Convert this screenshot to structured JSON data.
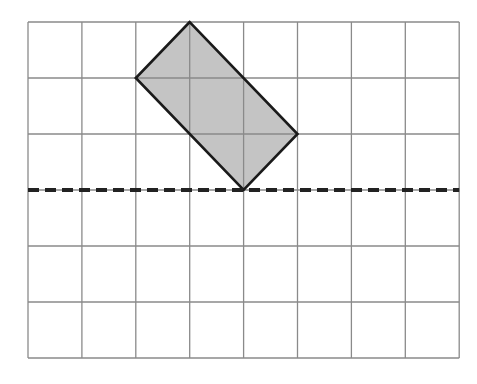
{
  "diagram": {
    "type": "grid-reflection",
    "grid": {
      "columns": 8,
      "rows": 6,
      "origin_px": [
        28,
        22
      ],
      "cell_w": 53.9,
      "cell_h": 56,
      "line_color": "#8a8a8a"
    },
    "shape": {
      "name": "rectangle",
      "fill": "#c4c4c4",
      "stroke": "#1a1a1a",
      "vertices_grid": [
        [
          3,
          0
        ],
        [
          2,
          1
        ],
        [
          4,
          3
        ],
        [
          5,
          2
        ]
      ]
    },
    "reflection_line": {
      "style": "dashed",
      "orientation": "horizontal",
      "grid_row": 3,
      "color": "#222222"
    }
  }
}
